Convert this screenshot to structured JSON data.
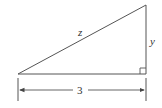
{
  "diagram": {
    "type": "right-triangle",
    "colors": {
      "stroke": "#555555",
      "text": "#333333",
      "background": "#ffffff"
    },
    "labels": {
      "hypotenuse": "z",
      "vertical_leg": "y",
      "base_dimension": "3"
    }
  }
}
